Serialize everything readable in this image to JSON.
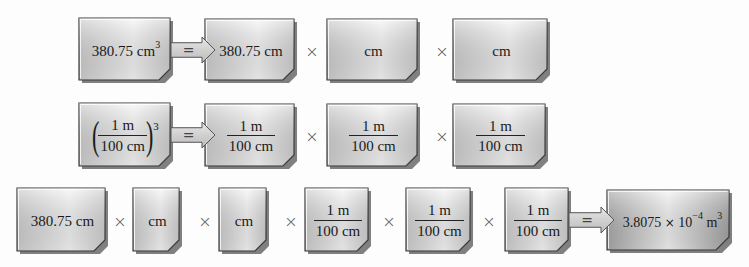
{
  "figure": {
    "colors": {
      "box_fill_light": "#f4f4f4",
      "box_fill_mid": "#d8d8d8",
      "box_border": "#3a3a3a",
      "arrow_fill": "#cfcfcf",
      "result_fill_dark": "#b0b0b0"
    },
    "symbols": {
      "times": "×",
      "equals": "="
    },
    "row1": {
      "start_value": "380.75 cm",
      "start_exponent": "3",
      "expanded": [
        "380.75 cm",
        "cm",
        "cm"
      ]
    },
    "row2": {
      "factor_numerator": "1 m",
      "factor_denominator": "100 cm",
      "factor_exponent": "3",
      "expanded": [
        {
          "numerator": "1 m",
          "denominator": "100 cm"
        },
        {
          "numerator": "1 m",
          "denominator": "100 cm"
        },
        {
          "numerator": "1 m",
          "denominator": "100 cm"
        }
      ]
    },
    "row3": {
      "terms": [
        "380.75 cm",
        "cm",
        "cm"
      ],
      "factors": [
        {
          "numerator": "1 m",
          "denominator": "100 cm"
        },
        {
          "numerator": "1 m",
          "denominator": "100 cm"
        },
        {
          "numerator": "1 m",
          "denominator": "100 cm"
        }
      ],
      "result": {
        "mantissa": "3.8075",
        "times": "×",
        "base": "10",
        "exponent": "−4",
        "unit": "m",
        "unit_exponent": "3"
      }
    }
  }
}
